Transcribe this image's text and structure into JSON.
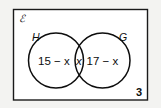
{
  "figure": {
    "type": "venn-diagram",
    "universal_set_symbol": "ℰ",
    "universal_set_name": "script-epsilon-universal-set",
    "border_color": "#1a1a1a",
    "background_color": "#ffffff",
    "outside_color": "#f3f3f1",
    "stroke_color": "#0d0d0d",
    "sets": [
      {
        "label": "H",
        "name": "set-h"
      },
      {
        "label": "G",
        "name": "set-g"
      }
    ],
    "regions": [
      {
        "name": "h-only",
        "label": "15 − x"
      },
      {
        "name": "intersection",
        "label": "x"
      },
      {
        "name": "g-only",
        "label": "17 − x"
      }
    ],
    "region_h_only": "15 − x",
    "region_intersection": "x",
    "region_g_only": "17 − x",
    "page_number": "3"
  }
}
